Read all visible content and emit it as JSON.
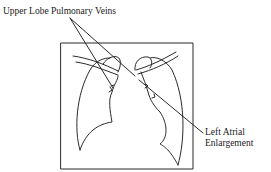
{
  "diagram": {
    "type": "chest radiograph schematic",
    "labels": {
      "upper_lobe": "Upper Lobe Pulmonary Veins",
      "left_atrial_line1": "Left Atrial",
      "left_atrial_line2": "Enlargement"
    },
    "colors": {
      "stroke": "#2a2a2a",
      "background": "#ffffff"
    }
  }
}
